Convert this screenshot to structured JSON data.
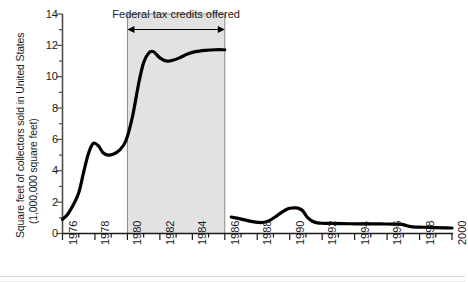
{
  "chart_data": {
    "type": "line",
    "title": "",
    "xlabel": "",
    "ylabel": "Square feet of collectors sold in United States",
    "ylabel_line2": "(1,000,000 square feet)",
    "xlim": [
      1976,
      2000
    ],
    "ylim": [
      0,
      14
    ],
    "grid": false,
    "legend": null,
    "x_ticks": [
      1976,
      1978,
      1980,
      1982,
      1984,
      1986,
      1988,
      1990,
      1992,
      1994,
      1996,
      1998,
      2000
    ],
    "x_tick_labels": [
      "1976",
      "1978",
      "1980",
      "1982",
      "1984",
      "1986",
      "1988",
      "1990",
      "1992",
      "1994",
      "1996",
      "1998",
      "2000"
    ],
    "x_minor_tick_interval": 1,
    "y_ticks": [
      0,
      2,
      4,
      6,
      8,
      10,
      12,
      14
    ],
    "y_tick_labels": [
      "0",
      "2",
      "4",
      "6",
      "8",
      "10",
      "12",
      "14"
    ],
    "y_minor_tick_interval": 1,
    "annotations": [
      {
        "name": "federal-tax-credits-span",
        "text": "Federal tax credits offered",
        "x_start": 1980,
        "x_end": 1986,
        "style": "double-headed-arrow-with-shaded-band",
        "band_color": "#e2e2e2"
      }
    ],
    "series": [
      {
        "name": "Square feet of collectors sold (pre-credit expiry)",
        "segment": "1976-1986",
        "color": "#000000",
        "x": [
          1976.0,
          1976.3,
          1976.6,
          1977.0,
          1977.3,
          1977.6,
          1977.9,
          1978.2,
          1978.5,
          1978.8,
          1979.1,
          1979.5,
          1979.9,
          1980.3,
          1980.7,
          1981.0,
          1981.3,
          1981.6,
          1982.0,
          1982.4,
          1982.8,
          1983.2,
          1983.7,
          1984.2,
          1984.8,
          1985.4,
          1986.0
        ],
        "y": [
          0.9,
          1.2,
          1.7,
          2.6,
          3.9,
          5.1,
          5.75,
          5.6,
          5.15,
          5.0,
          5.05,
          5.3,
          5.9,
          7.4,
          9.6,
          10.9,
          11.5,
          11.6,
          11.2,
          11.0,
          11.05,
          11.2,
          11.45,
          11.6,
          11.68,
          11.72,
          11.72
        ]
      },
      {
        "name": "Square feet of collectors sold (post-credit expiry)",
        "segment": "1986.4-2000",
        "color": "#000000",
        "x": [
          1986.4,
          1986.9,
          1987.4,
          1987.9,
          1988.3,
          1988.7,
          1989.1,
          1989.5,
          1989.9,
          1990.2,
          1990.5,
          1990.8,
          1991.1,
          1991.4,
          1991.7,
          1992.1,
          1992.6,
          1993.2,
          1994.0,
          1994.8,
          1995.6,
          1996.4,
          1996.9,
          1997.2,
          1997.6,
          1998.2,
          1999.0,
          1999.6,
          2000.0
        ],
        "y": [
          1.05,
          0.95,
          0.82,
          0.72,
          0.7,
          0.8,
          1.05,
          1.35,
          1.58,
          1.63,
          1.62,
          1.45,
          1.02,
          0.78,
          0.68,
          0.65,
          0.64,
          0.63,
          0.62,
          0.62,
          0.61,
          0.6,
          0.58,
          0.5,
          0.42,
          0.4,
          0.38,
          0.36,
          0.35
        ]
      }
    ]
  },
  "axes": {
    "y_title_line1": "Square feet of collectors sold in United States",
    "y_title_line2": "(1,000,000 square feet)"
  }
}
